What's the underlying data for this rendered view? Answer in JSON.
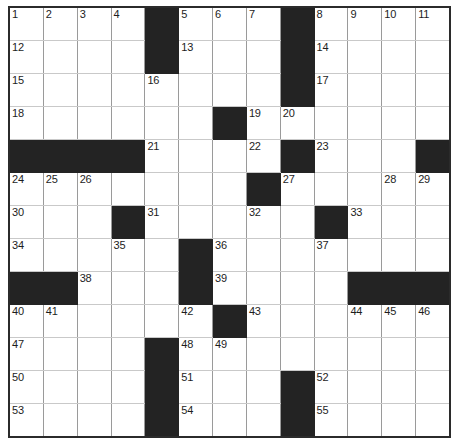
{
  "puzzle": {
    "type": "crossword-grid",
    "columns": 12,
    "rows": 13,
    "colors": {
      "block": "#232323",
      "cell": "#ffffff",
      "border": "#2b2b2b",
      "gridline": "#9a9a9a",
      "number_text": "#1d1d1d"
    },
    "max_clue_number": 55,
    "grid": [
      [
        {
          "n": "1",
          "b": false
        },
        {
          "n": "2",
          "b": false
        },
        {
          "n": "3",
          "b": false
        },
        {
          "n": "4",
          "b": false
        },
        {
          "n": "",
          "b": true
        },
        {
          "n": "5",
          "b": false
        },
        {
          "n": "6",
          "b": false
        },
        {
          "n": "7",
          "b": false
        },
        {
          "n": "",
          "b": true
        },
        {
          "n": "8",
          "b": false
        },
        {
          "n": "9",
          "b": false
        },
        {
          "n": "10",
          "b": false
        },
        {
          "n": "11",
          "b": false
        }
      ],
      [
        {
          "n": "12",
          "b": false
        },
        {
          "n": "",
          "b": false
        },
        {
          "n": "",
          "b": false
        },
        {
          "n": "",
          "b": false
        },
        {
          "n": "",
          "b": true
        },
        {
          "n": "13",
          "b": false
        },
        {
          "n": "",
          "b": false
        },
        {
          "n": "",
          "b": false
        },
        {
          "n": "",
          "b": true
        },
        {
          "n": "14",
          "b": false
        },
        {
          "n": "",
          "b": false
        },
        {
          "n": "",
          "b": false
        },
        {
          "n": "",
          "b": false
        }
      ],
      [
        {
          "n": "15",
          "b": false
        },
        {
          "n": "",
          "b": false
        },
        {
          "n": "",
          "b": false
        },
        {
          "n": "",
          "b": false
        },
        {
          "n": "16",
          "b": false
        },
        {
          "n": "",
          "b": false
        },
        {
          "n": "",
          "b": false
        },
        {
          "n": "",
          "b": false
        },
        {
          "n": "",
          "b": true
        },
        {
          "n": "17",
          "b": false
        },
        {
          "n": "",
          "b": false
        },
        {
          "n": "",
          "b": false
        },
        {
          "n": "",
          "b": false
        }
      ],
      [
        {
          "n": "18",
          "b": false
        },
        {
          "n": "",
          "b": false
        },
        {
          "n": "",
          "b": false
        },
        {
          "n": "",
          "b": false
        },
        {
          "n": "",
          "b": false
        },
        {
          "n": "",
          "b": false
        },
        {
          "n": "",
          "b": true
        },
        {
          "n": "19",
          "b": false
        },
        {
          "n": "20",
          "b": false
        },
        {
          "n": "",
          "b": false
        },
        {
          "n": "",
          "b": false
        },
        {
          "n": "",
          "b": false
        },
        {
          "n": "",
          "b": false
        }
      ],
      [
        {
          "n": "",
          "b": true
        },
        {
          "n": "",
          "b": true
        },
        {
          "n": "",
          "b": true
        },
        {
          "n": "",
          "b": true
        },
        {
          "n": "21",
          "b": false
        },
        {
          "n": "",
          "b": false
        },
        {
          "n": "",
          "b": false
        },
        {
          "n": "22",
          "b": false
        },
        {
          "n": "",
          "b": true
        },
        {
          "n": "23",
          "b": false
        },
        {
          "n": "",
          "b": false
        },
        {
          "n": "",
          "b": false
        },
        {
          "n": "",
          "b": true
        }
      ],
      [
        {
          "n": "24",
          "b": false
        },
        {
          "n": "25",
          "b": false
        },
        {
          "n": "26",
          "b": false
        },
        {
          "n": "",
          "b": false
        },
        {
          "n": "",
          "b": false
        },
        {
          "n": "",
          "b": false
        },
        {
          "n": "",
          "b": false
        },
        {
          "n": "",
          "b": true
        },
        {
          "n": "27",
          "b": false
        },
        {
          "n": "",
          "b": false
        },
        {
          "n": "",
          "b": false
        },
        {
          "n": "28",
          "b": false
        },
        {
          "n": "29",
          "b": false
        }
      ],
      [
        {
          "n": "30",
          "b": false
        },
        {
          "n": "",
          "b": false
        },
        {
          "n": "",
          "b": false
        },
        {
          "n": "",
          "b": true
        },
        {
          "n": "31",
          "b": false
        },
        {
          "n": "",
          "b": false
        },
        {
          "n": "",
          "b": false
        },
        {
          "n": "32",
          "b": false
        },
        {
          "n": "",
          "b": false
        },
        {
          "n": "",
          "b": true
        },
        {
          "n": "33",
          "b": false
        },
        {
          "n": "",
          "b": false
        },
        {
          "n": "",
          "b": false
        }
      ],
      [
        {
          "n": "34",
          "b": false
        },
        {
          "n": "",
          "b": false
        },
        {
          "n": "",
          "b": false
        },
        {
          "n": "35",
          "b": false
        },
        {
          "n": "",
          "b": false
        },
        {
          "n": "",
          "b": true
        },
        {
          "n": "36",
          "b": false
        },
        {
          "n": "",
          "b": false
        },
        {
          "n": "",
          "b": false
        },
        {
          "n": "37",
          "b": false
        },
        {
          "n": "",
          "b": false
        },
        {
          "n": "",
          "b": false
        },
        {
          "n": "",
          "b": false
        }
      ],
      [
        {
          "n": "",
          "b": true
        },
        {
          "n": "",
          "b": true
        },
        {
          "n": "38",
          "b": false
        },
        {
          "n": "",
          "b": false
        },
        {
          "n": "",
          "b": false
        },
        {
          "n": "",
          "b": true
        },
        {
          "n": "39",
          "b": false
        },
        {
          "n": "",
          "b": false
        },
        {
          "n": "",
          "b": false
        },
        {
          "n": "",
          "b": false
        },
        {
          "n": "",
          "b": true
        },
        {
          "n": "",
          "b": true
        },
        {
          "n": "",
          "b": true
        }
      ],
      [
        {
          "n": "40",
          "b": false
        },
        {
          "n": "41",
          "b": false
        },
        {
          "n": "",
          "b": false
        },
        {
          "n": "",
          "b": false
        },
        {
          "n": "",
          "b": false
        },
        {
          "n": "42",
          "b": false
        },
        {
          "n": "",
          "b": true
        },
        {
          "n": "43",
          "b": false
        },
        {
          "n": "",
          "b": false
        },
        {
          "n": "",
          "b": false
        },
        {
          "n": "44",
          "b": false
        },
        {
          "n": "45",
          "b": false
        },
        {
          "n": "46",
          "b": false
        }
      ],
      [
        {
          "n": "47",
          "b": false
        },
        {
          "n": "",
          "b": false
        },
        {
          "n": "",
          "b": false
        },
        {
          "n": "",
          "b": false
        },
        {
          "n": "",
          "b": true
        },
        {
          "n": "48",
          "b": false
        },
        {
          "n": "49",
          "b": false
        },
        {
          "n": "",
          "b": false
        },
        {
          "n": "",
          "b": false
        },
        {
          "n": "",
          "b": false
        },
        {
          "n": "",
          "b": false
        },
        {
          "n": "",
          "b": false
        },
        {
          "n": "",
          "b": false
        }
      ],
      [
        {
          "n": "50",
          "b": false
        },
        {
          "n": "",
          "b": false
        },
        {
          "n": "",
          "b": false
        },
        {
          "n": "",
          "b": false
        },
        {
          "n": "",
          "b": true
        },
        {
          "n": "51",
          "b": false
        },
        {
          "n": "",
          "b": false
        },
        {
          "n": "",
          "b": false
        },
        {
          "n": "",
          "b": true
        },
        {
          "n": "52",
          "b": false
        },
        {
          "n": "",
          "b": false
        },
        {
          "n": "",
          "b": false
        },
        {
          "n": "",
          "b": false
        }
      ],
      [
        {
          "n": "53",
          "b": false
        },
        {
          "n": "",
          "b": false
        },
        {
          "n": "",
          "b": false
        },
        {
          "n": "",
          "b": false
        },
        {
          "n": "",
          "b": true
        },
        {
          "n": "54",
          "b": false
        },
        {
          "n": "",
          "b": false
        },
        {
          "n": "",
          "b": false
        },
        {
          "n": "",
          "b": true
        },
        {
          "n": "55",
          "b": false
        },
        {
          "n": "",
          "b": false
        },
        {
          "n": "",
          "b": false
        },
        {
          "n": "",
          "b": false
        }
      ]
    ]
  }
}
